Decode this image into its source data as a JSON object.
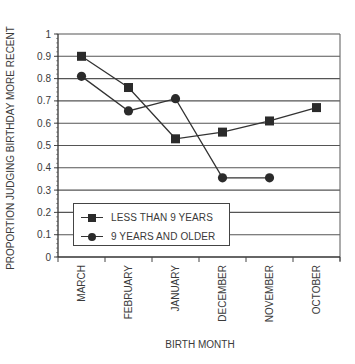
{
  "chart_data": {
    "type": "line",
    "title": "",
    "xlabel": "BIRTH MONTH",
    "ylabel": "PROPORTION JUDGING BIRTHDAY MORE RECENT",
    "categories": [
      "MARCH",
      "FEBRUARY",
      "JANUARY",
      "DECEMBER",
      "NOVEMBER",
      "OCTOBER"
    ],
    "ylim": [
      0,
      1
    ],
    "yticks": [
      "0",
      "0.1",
      "0.2",
      "0.3",
      "0.4",
      "0.5",
      "0.6",
      "0.7",
      "0.8",
      "0.9",
      "1"
    ],
    "grid": true,
    "legend_position": "lower left (inside plot)",
    "series": [
      {
        "name": "LESS THAN 9 YEARS",
        "marker": "square",
        "values": [
          0.9,
          0.76,
          0.53,
          0.56,
          0.61,
          0.67
        ]
      },
      {
        "name": "9 YEARS AND OLDER",
        "marker": "circle",
        "values": [
          0.81,
          0.655,
          0.71,
          0.355,
          0.355,
          null
        ]
      }
    ]
  },
  "legend": {
    "items": [
      {
        "label": "LESS THAN 9 YEARS"
      },
      {
        "label": "9 YEARS AND OLDER"
      }
    ]
  }
}
